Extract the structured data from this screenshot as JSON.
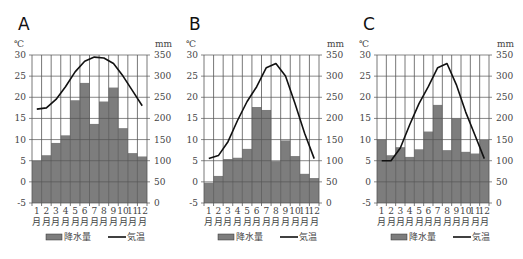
{
  "chart_data": [
    {
      "type": "bar+line",
      "title": "A",
      "categories": [
        "1月",
        "2月",
        "3月",
        "4月",
        "5月",
        "6月",
        "7月",
        "8月",
        "9月",
        "10月",
        "11月",
        "12月"
      ],
      "series": [
        {
          "name": "降水量",
          "type": "bar",
          "axis": "right",
          "unit": "mm",
          "values": [
            100,
            113,
            142,
            160,
            243,
            284,
            187,
            240,
            273,
            177,
            118,
            110
          ]
        },
        {
          "name": "気温",
          "type": "line",
          "axis": "left",
          "unit": "℃",
          "values": [
            17.2,
            17.5,
            19.5,
            22.5,
            26,
            28.5,
            29.5,
            29.3,
            28,
            25,
            21.5,
            18
          ]
        }
      ],
      "ylabel_left": "℃",
      "ylabel_right": "mm",
      "ylim_left": [
        -5,
        30
      ],
      "ylim_right": [
        0,
        350
      ],
      "yticks_left": [
        30,
        25,
        20,
        15,
        10,
        5,
        0,
        -5
      ],
      "yticks_right": [
        350,
        300,
        250,
        200,
        150,
        100,
        50,
        0
      ],
      "grid": true,
      "legend_position": "bottom"
    },
    {
      "type": "bar+line",
      "title": "B",
      "categories": [
        "1月",
        "2月",
        "3月",
        "4月",
        "5月",
        "6月",
        "7月",
        "8月",
        "9月",
        "10月",
        "11月",
        "12月"
      ],
      "series": [
        {
          "name": "降水量",
          "type": "bar",
          "axis": "right",
          "unit": "mm",
          "values": [
            48,
            64,
            104,
            107,
            128,
            227,
            220,
            99,
            148,
            111,
            69,
            59
          ]
        },
        {
          "name": "気温",
          "type": "line",
          "axis": "left",
          "unit": "℃",
          "values": [
            5.5,
            6.2,
            9.5,
            14.5,
            19,
            22.5,
            27,
            28,
            25,
            18.5,
            11.5,
            5.5
          ]
        }
      ],
      "ylabel_left": "℃",
      "ylabel_right": "mm",
      "ylim_left": [
        -5,
        30
      ],
      "ylim_right": [
        0,
        350
      ],
      "yticks_left": [
        30,
        25,
        20,
        15,
        10,
        5,
        0,
        -5
      ],
      "yticks_right": [
        350,
        300,
        250,
        200,
        150,
        100,
        50,
        0
      ],
      "grid": true,
      "legend_position": "bottom"
    },
    {
      "type": "bar+line",
      "title": "C",
      "categories": [
        "1月",
        "2月",
        "3月",
        "4月",
        "5月",
        "6月",
        "7月",
        "8月",
        "9月",
        "10月",
        "11月",
        "12月"
      ],
      "series": [
        {
          "name": "降水量",
          "type": "bar",
          "axis": "right",
          "unit": "mm",
          "values": [
            150,
            113,
            132,
            109,
            127,
            169,
            232,
            125,
            200,
            121,
            117,
            149
          ]
        },
        {
          "name": "気温",
          "type": "line",
          "axis": "left",
          "unit": "℃",
          "values": [
            5,
            5,
            8,
            13.5,
            18.5,
            22.5,
            27,
            28,
            23,
            16.5,
            11,
            5.5
          ]
        }
      ],
      "ylabel_left": "℃",
      "ylabel_right": "mm",
      "ylim_left": [
        -5,
        30
      ],
      "ylim_right": [
        0,
        350
      ],
      "yticks_left": [
        30,
        25,
        20,
        15,
        10,
        5,
        0,
        -5
      ],
      "yticks_right": [
        350,
        300,
        250,
        200,
        150,
        100,
        50,
        0
      ],
      "grid": true,
      "legend_position": "bottom"
    }
  ],
  "charts": [
    {
      "letter": "A",
      "left_unit": "℃",
      "right_unit": "mm"
    },
    {
      "letter": "B",
      "left_unit": "℃",
      "right_unit": "mm"
    },
    {
      "letter": "C",
      "left_unit": "℃",
      "right_unit": "mm"
    }
  ],
  "legend": {
    "bar_label": "降水量",
    "line_label": "気温"
  },
  "month_numbers": [
    "1",
    "2",
    "3",
    "4",
    "5",
    "6",
    "7",
    "8",
    "9",
    "10",
    "11",
    "12"
  ],
  "month_suffix": "月",
  "colors": {
    "bar": "#7d7d7d",
    "bar_edge": "#333333",
    "line": "#111111",
    "grid": "#555555",
    "text": "#444444"
  }
}
